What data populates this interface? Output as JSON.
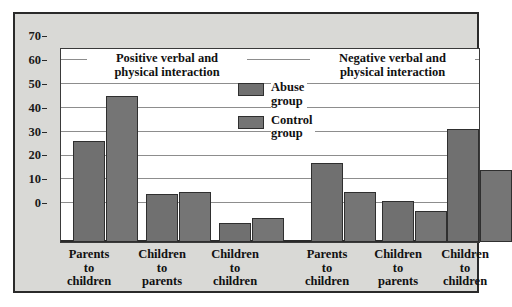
{
  "chart_data": {
    "type": "bar",
    "title": "",
    "xlabel": "",
    "ylabel": "",
    "ylim": [
      0,
      70
    ],
    "yticks": [
      0,
      10,
      20,
      30,
      40,
      50,
      60,
      70
    ],
    "grid": true,
    "legend_position": "inside-top-center",
    "section_titles": [
      "Positive verbal and physical interaction",
      "Negative verbal and physical interaction"
    ],
    "categories": [
      "Parents to children",
      "Children to parents",
      "Children to children",
      "Parents to children",
      "Children to parents",
      "Children to children"
    ],
    "series": [
      {
        "name": "Abuse group",
        "values": [
          42,
          20,
          8,
          33,
          17,
          47
        ]
      },
      {
        "name": "Control group",
        "values": [
          61,
          21,
          10,
          21,
          13,
          30
        ]
      }
    ]
  },
  "chart": {
    "sections": [
      {
        "title_line1": "Positive verbal and",
        "title_line2": "physical interaction"
      },
      {
        "title_line1": "Negative verbal and",
        "title_line2": "physical interaction"
      }
    ],
    "legend": [
      {
        "label_line1": "Abuse",
        "label_line2": "group"
      },
      {
        "label_line1": "Control",
        "label_line2": "group"
      }
    ],
    "ytick_labels": [
      "70",
      "60",
      "50",
      "40",
      "30",
      "20",
      "10",
      "0"
    ],
    "categories": [
      {
        "line1": "Parents",
        "line2": "to",
        "line3": "children"
      },
      {
        "line1": "Children",
        "line2": "to",
        "line3": "parents"
      },
      {
        "line1": "Children",
        "line2": "to",
        "line3": "children"
      },
      {
        "line1": "Parents",
        "line2": "to",
        "line3": "children"
      },
      {
        "line1": "Children",
        "line2": "to",
        "line3": "parents"
      },
      {
        "line1": "Children",
        "line2": "to",
        "line3": "children"
      }
    ],
    "colors": {
      "abuse_bar": "#707070",
      "control_bar": "#757575",
      "bar_outline": "#2f2f2f",
      "panel_background": "#d9d9d6",
      "plot_background": "#ffffff",
      "gridline": "#8d8d8d",
      "axis": "#2a2a2a",
      "text": "#111111"
    }
  }
}
